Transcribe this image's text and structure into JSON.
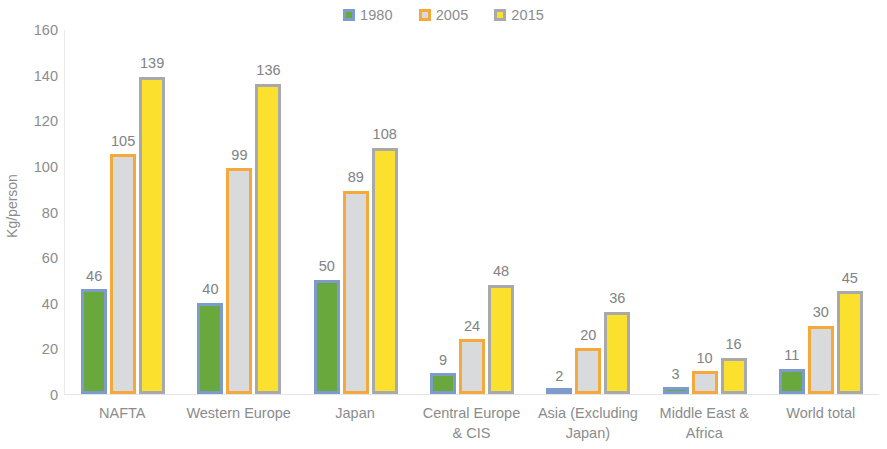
{
  "chart_data": {
    "type": "bar",
    "title": "",
    "subtitle": "",
    "xlabel": "",
    "ylabel": "Kg/person",
    "ylim": [
      0,
      160
    ],
    "ytick_step": 20,
    "yticks": [
      160,
      140,
      120,
      100,
      80,
      60,
      40,
      20,
      0
    ],
    "grid": false,
    "legend_position": "top-center",
    "categories": [
      "NAFTA",
      "Western Europe",
      "Japan",
      "Central Europe\n& CIS",
      "Asia (Excluding\nJapan)",
      "Middle East &\nAfrica",
      "World total"
    ],
    "series": [
      {
        "name": "1980",
        "values": [
          46,
          40,
          50,
          9,
          2,
          3,
          11
        ]
      },
      {
        "name": "2005",
        "values": [
          105,
          99,
          89,
          24,
          20,
          10,
          30
        ]
      },
      {
        "name": "2015",
        "values": [
          139,
          136,
          108,
          48,
          36,
          16,
          45
        ]
      }
    ],
    "series_colors": [
      {
        "name": "1980",
        "border": "#7e9ccb",
        "fill": "#69a83c"
      },
      {
        "name": "2005",
        "border": "#f5a93c",
        "fill": "#d9dadb"
      },
      {
        "name": "2015",
        "border": "#a7a9ac",
        "fill": "#fbe02e"
      }
    ],
    "data_labels": true,
    "background": "#ffffff",
    "text_color": "#8a8c8e"
  }
}
